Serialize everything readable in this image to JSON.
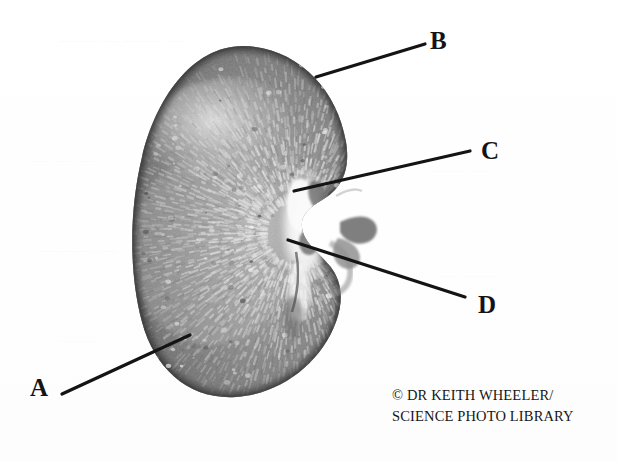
{
  "figure": {
    "kind": "anatomical-specimen-photograph",
    "background_color": "#ffffff",
    "ink_color": "#141414"
  },
  "labels": [
    {
      "id": "A",
      "text": "A",
      "x": 30,
      "y": 375,
      "leader": {
        "x1": 62,
        "y1": 394,
        "x2": 190,
        "y2": 335
      }
    },
    {
      "id": "B",
      "text": "B",
      "x": 430,
      "y": 28,
      "leader": {
        "x1": 425,
        "y1": 44,
        "x2": 316,
        "y2": 77
      }
    },
    {
      "id": "C",
      "text": "C",
      "x": 481,
      "y": 138,
      "leader": {
        "x1": 470,
        "y1": 151,
        "x2": 294,
        "y2": 191
      }
    },
    {
      "id": "D",
      "text": "D",
      "x": 478,
      "y": 292,
      "leader": {
        "x1": 465,
        "y1": 297,
        "x2": 288,
        "y2": 240
      }
    }
  ],
  "credit": {
    "line1": "© DR KEITH WHEELER/",
    "line2": "SCIENCE PHOTO LIBRARY"
  },
  "ghost_text": [
    {
      "text": "— —  —",
      "x": 30,
      "y": 150
    },
    {
      "text": "—— — —— —",
      "x": 60,
      "y": 30
    },
    {
      "text": "——— —",
      "x": 40,
      "y": 240
    },
    {
      "text": "—— —",
      "x": 430,
      "y": 160
    },
    {
      "text": "— ——",
      "x": 440,
      "y": 265
    },
    {
      "text": "——",
      "x": 60,
      "y": 330
    }
  ],
  "specimen": {
    "outline_note": "bean-shaped coronal section, hilum facing right",
    "bounds": {
      "left": 133,
      "top": 46,
      "right": 348,
      "bottom": 398
    },
    "regions": [
      {
        "name": "cortex",
        "tone": "#6e6e6e"
      },
      {
        "name": "medulla",
        "tone": "#8d8d8d"
      },
      {
        "name": "hilum",
        "tone": "#f2f2f2"
      },
      {
        "name": "vessels",
        "tone": "#555555"
      }
    ]
  }
}
